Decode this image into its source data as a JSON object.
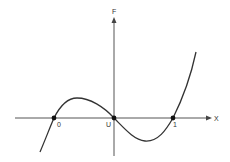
{
  "diagram": {
    "type": "function-plot",
    "y_axis_label": "F",
    "x_axis_label": "X",
    "root_labels": [
      "0",
      "U",
      "1"
    ],
    "curve": "cubic with roots at 0, U, 1; local maximum between 0 and U, local minimum between U and 1",
    "colors": {
      "line": "#333333",
      "axis": "#555555",
      "background": "#ffffff"
    }
  }
}
